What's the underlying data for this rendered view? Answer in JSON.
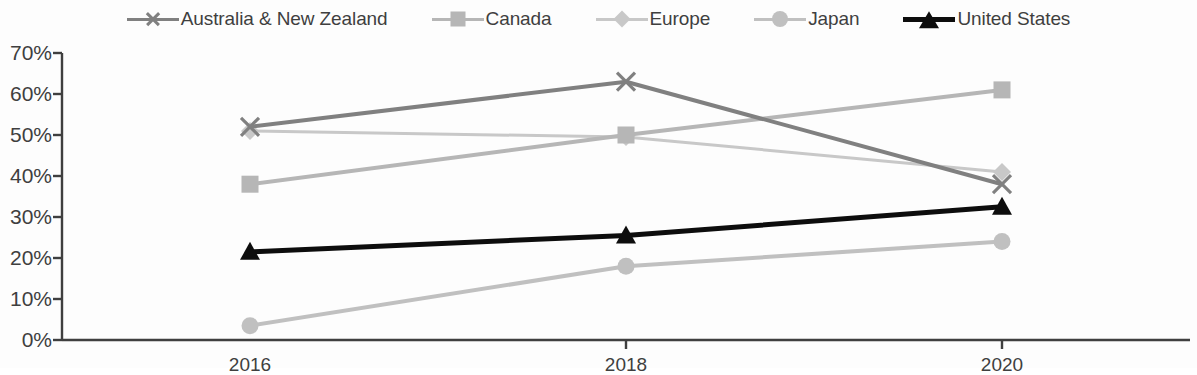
{
  "chart_data": {
    "type": "line",
    "title": "",
    "subtitle": "",
    "xlabel": "",
    "ylabel": "",
    "categories": [
      "2016",
      "2018",
      "2020"
    ],
    "x_tick_labels": [
      "2016",
      "2018",
      "2020"
    ],
    "y_tick_labels": [
      "0%",
      "10%",
      "20%",
      "30%",
      "40%",
      "50%",
      "60%",
      "70%"
    ],
    "y_tick_values": [
      0,
      10,
      20,
      30,
      40,
      50,
      60,
      70
    ],
    "ylim": [
      0,
      70
    ],
    "grid": false,
    "legend_position": "top",
    "value_suffix": "%",
    "series": [
      {
        "name": "Australia & New Zealand",
        "marker": "x-marker",
        "color": "#808080",
        "line_width": 4,
        "values": [
          52,
          63,
          38
        ]
      },
      {
        "name": "Canada",
        "marker": "square-marker",
        "color": "#b6b6b6",
        "line_width": 4,
        "values": [
          38,
          50,
          61
        ]
      },
      {
        "name": "Europe",
        "marker": "diamond-marker",
        "color": "#c8c8c8",
        "line_width": 3,
        "values": [
          51,
          49.5,
          41
        ]
      },
      {
        "name": "Japan",
        "marker": "circle-marker",
        "color": "#c0c0c0",
        "line_width": 4,
        "values": [
          3.5,
          18,
          24
        ]
      },
      {
        "name": "United States",
        "marker": "triangle-marker",
        "color": "#0d0d0d",
        "line_width": 5,
        "values": [
          21.5,
          25.5,
          32.5
        ]
      }
    ]
  },
  "legend": {
    "items": [
      {
        "label": "Australia & New Zealand",
        "marker": "x-marker",
        "color": "#808080"
      },
      {
        "label": "Canada",
        "marker": "square-marker",
        "color": "#b6b6b6"
      },
      {
        "label": "Europe",
        "marker": "diamond-marker",
        "color": "#c8c8c8"
      },
      {
        "label": "Japan",
        "marker": "circle-marker",
        "color": "#c0c0c0"
      },
      {
        "label": "United States",
        "marker": "triangle-marker",
        "color": "#0d0d0d"
      }
    ]
  },
  "axes": {
    "axis_color": "#3f3f3f",
    "background": "#fdfdfd"
  }
}
